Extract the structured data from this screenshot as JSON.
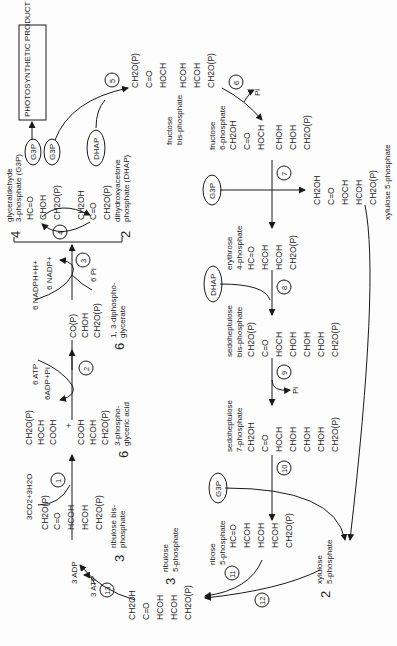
{
  "diagram": {
    "orientation": "rotated 90 degrees counter-clockwise",
    "product_box": "PHOTOSYNTHETIC PRODUCT",
    "intermediates": {
      "g3p_badge": "G3P",
      "dhap_badge": "DHAP"
    },
    "molecules": {
      "rubp": {
        "coef": "3",
        "name_1": "ribulose bis-",
        "name_2": "phosphate",
        "formula": [
          "CH2O(P)",
          "C=O",
          "HCOH",
          "HCOH",
          "CH2O(P)"
        ]
      },
      "pga": {
        "coef": "6",
        "name_1": "3-phospho-",
        "name_2": "glyceric acid",
        "formula": [
          "CH2O(P)",
          "HOCH",
          "COOH",
          "+",
          "COOH",
          "HCOH",
          "CH2O(P)"
        ]
      },
      "dpga": {
        "coef": "6",
        "name_1": "1, 3-diphospho-",
        "name_2": "glycerate",
        "formula": [
          "CO(P)",
          "CHOH",
          "CH2O(P)"
        ]
      },
      "g3p": {
        "coef": "4",
        "name_1": "glyceraldehyde",
        "name_2": "3-phosphate (G3P)",
        "formula": [
          "HC=O",
          "CHOH",
          "CH2O(P)"
        ]
      },
      "dhap": {
        "coef": "2",
        "name_1": "dihydroxyacetone",
        "name_2": "phosphate (DHAP)",
        "formula": [
          "CH2OH",
          "C=O",
          "CH2O(P)"
        ]
      },
      "fbp": {
        "name_1": "fructose",
        "name_2": "bis-phosphate",
        "formula": [
          "CH2O(P)",
          "C=O",
          "HOCH",
          "HCOH",
          "HCOH",
          "CH2O(P)"
        ]
      },
      "f6p": {
        "name_1": "fructose",
        "name_2": "6-phosphate",
        "formula": [
          "CH2OH",
          "C=O",
          "HOCH",
          "CHOH",
          "CHOH",
          "CH2O(P)"
        ]
      },
      "x5p_a": {
        "name_1": "xylulose 5-phosphate",
        "formula": [
          "CH2OH",
          "C=O",
          "HOCH",
          "HCOH",
          "CH2O(P)"
        ]
      },
      "e4p": {
        "name_1": "erythrose",
        "name_2": "4-phosphate",
        "formula": [
          "HC=O",
          "HCOH",
          "HCOH",
          "CH2O(P)"
        ]
      },
      "sbp": {
        "name_1": "sedoheptulose",
        "name_2": "bis-phosphate",
        "formula": [
          "CH2O(P)",
          "C=O",
          "HOCH",
          "CHOH",
          "CHOH",
          "CHOH",
          "CH2O(P)"
        ]
      },
      "s7p": {
        "name_1": "sedoheptulose",
        "name_2": "7-phosphate",
        "formula": [
          "CH2OH",
          "C=O",
          "HOCH",
          "CHOH",
          "CHOH",
          "CHOH",
          "CH2O(P)"
        ]
      },
      "r5p": {
        "name_1": "ribose",
        "name_2": "5-phosphate",
        "formula": [
          "HC=O",
          "HCOH",
          "HCOH",
          "HCOH",
          "CH2O(P)"
        ]
      },
      "x5p_b": {
        "coef": "2",
        "name_1": "xylulose",
        "name_2": "5-phosphate"
      },
      "ru5p": {
        "coef": "3",
        "name_1": "ribulose",
        "name_2": "5-phosphate",
        "formula": [
          "CH2OH",
          "C=O",
          "HCOH",
          "HCOH",
          "CH2O(P)"
        ]
      }
    },
    "cofactors": {
      "step1": "3CO2+3H2O",
      "step2_in": "6 ATP",
      "step2_out": "6ADP+Pi",
      "step3_in": "6 NADPH+H+",
      "step3_out1": "6 NADP+",
      "step3_out2": "6 Pi",
      "step6_out": "Pi",
      "step9_out": "Pi",
      "step13_in": "3 ATP",
      "step13_out": "3 ADP"
    },
    "steps": [
      "1",
      "2",
      "3",
      "4",
      "5",
      "6",
      "7",
      "8",
      "9",
      "10",
      "11",
      "12",
      "13"
    ]
  }
}
